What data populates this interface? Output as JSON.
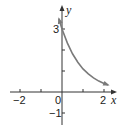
{
  "chart_data": {
    "type": "line",
    "title": "",
    "xlabel": "x",
    "ylabel": "y",
    "xlim": [
      -2.5,
      2.5
    ],
    "ylim": [
      -1.5,
      4
    ],
    "x_ticks": [
      -2,
      -1,
      0,
      1,
      2
    ],
    "x_tick_labels": [
      "−2",
      "0",
      "2"
    ],
    "y_ticks": [
      -1,
      1,
      2,
      3
    ],
    "y_tick_labels": [
      "3",
      "−1"
    ],
    "grid": false,
    "series": [
      {
        "name": "decaying exponential",
        "x": [
          -0.15,
          0,
          0.25,
          0.5,
          0.75,
          1,
          1.25,
          1.5,
          1.75,
          2,
          2.2
        ],
        "values": [
          3.49,
          3.0,
          2.34,
          1.82,
          1.42,
          1.1,
          0.86,
          0.67,
          0.52,
          0.41,
          0.33
        ],
        "color": "#7a7a7a",
        "arrows_both_ends": true
      }
    ],
    "annotations": [
      {
        "text": "3",
        "at": [
          0,
          3
        ],
        "note": "y-intercept"
      }
    ]
  },
  "labels": {
    "x_axis": "x",
    "y_axis": "y",
    "tick_neg2": "−2",
    "tick_0": "0",
    "tick_2": "2",
    "tick_3": "3",
    "tick_neg1": "−1"
  }
}
